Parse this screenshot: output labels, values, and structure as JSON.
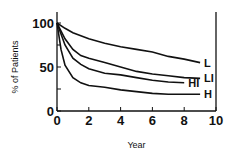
{
  "chart_data": {
    "type": "line",
    "title": "",
    "xlabel": "Year",
    "ylabel": "% of Patients",
    "xlim": [
      0,
      10
    ],
    "ylim": [
      0,
      100
    ],
    "xticks": [
      "0",
      "2",
      "4",
      "6",
      "8",
      "10"
    ],
    "yticks": [
      "0",
      "50",
      "100"
    ],
    "grid": false,
    "legend": "inline labels at curve ends",
    "series": [
      {
        "name": "L",
        "x": [
          0,
          0.5,
          1,
          2,
          3,
          4,
          5,
          6,
          7,
          8,
          9
        ],
        "values": [
          100,
          94,
          89,
          82,
          77,
          73,
          70,
          67,
          62,
          59,
          55
        ]
      },
      {
        "name": "LI",
        "x": [
          0,
          0.5,
          1,
          1.5,
          2,
          3,
          4,
          5,
          6,
          7,
          8,
          9
        ],
        "values": [
          100,
          82,
          70,
          63,
          60,
          55,
          50,
          45,
          42,
          40,
          38,
          37
        ]
      },
      {
        "name": "HI",
        "x": [
          0,
          0.5,
          1,
          1.5,
          2,
          3,
          4,
          5,
          6,
          7,
          8
        ],
        "values": [
          100,
          75,
          60,
          53,
          48,
          43,
          41,
          38,
          35,
          33,
          32
        ]
      },
      {
        "name": "H",
        "x": [
          0,
          0.25,
          0.5,
          1,
          1.5,
          2,
          3,
          4,
          5,
          6,
          7,
          8,
          9
        ],
        "values": [
          100,
          70,
          52,
          38,
          32,
          29,
          27,
          24,
          22,
          20,
          19,
          19,
          19
        ]
      }
    ]
  }
}
